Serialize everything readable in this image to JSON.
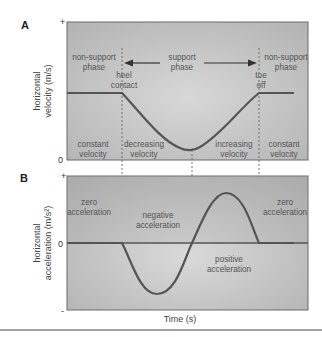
{
  "panels": {
    "a": {
      "letter": "A",
      "ylabel_line1": "horizontal",
      "ylabel_line2": "velocity (m/s)",
      "tick_top": "+",
      "tick_zero": "0",
      "labels": {
        "non_support_left_1": "non-support",
        "non_support_left_2": "phase",
        "heel_1": "heel",
        "heel_2": "contact",
        "support_1": "support",
        "support_2": "phase",
        "toe_1": "toe",
        "toe_2": "off",
        "non_support_right_1": "non-support",
        "non_support_right_2": "phase",
        "constant_left_1": "constant",
        "constant_left_2": "velocity",
        "decreasing_1": "decreasing",
        "decreasing_2": "velocity",
        "increasing_1": "increasing",
        "increasing_2": "velocity",
        "constant_right_1": "constant",
        "constant_right_2": "velocity"
      }
    },
    "b": {
      "letter": "B",
      "ylabel_line1": "horizontal",
      "ylabel_line2": "acceleration (m/s²)",
      "tick_top": "+",
      "tick_zero": "0",
      "tick_bottom": "-",
      "labels": {
        "zero_left_1": "zero",
        "zero_left_2": "acceleration",
        "negative_1": "negative",
        "negative_2": "acceleration",
        "positive_1": "positive",
        "positive_2": "acceleration",
        "zero_right_1": "zero",
        "zero_right_2": "acceleration"
      }
    },
    "xlabel": "Time (s)"
  },
  "colors": {
    "panel_fill": "#b9b9b9",
    "panel_fill_light": "#d4d4d4",
    "curve": "#555555",
    "frame": "#6a6a6a"
  }
}
